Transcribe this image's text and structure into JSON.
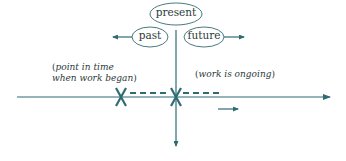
{
  "diagram": {
    "type": "timeline",
    "colors": {
      "line": "#2f6b72",
      "ellipse_stroke": "#4a7a80",
      "text": "#2b3a3a",
      "mark": "#2f6b72"
    },
    "top_labels": {
      "present": "present",
      "past": "past",
      "future": "future"
    },
    "notes": {
      "start_open": "(",
      "start_line1": "point in time",
      "start_line2": "when work began",
      "start_close": ")",
      "ongoing_open": "(",
      "ongoing_text": "work is ongoing",
      "ongoing_close": ")"
    },
    "marks": [
      {
        "name": "start-mark",
        "symbol": "X"
      },
      {
        "name": "now-mark",
        "symbol": "X"
      }
    ]
  }
}
